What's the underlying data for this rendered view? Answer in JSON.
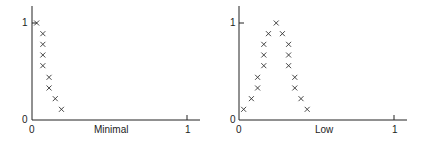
{
  "chart_data": [
    {
      "type": "scatter",
      "title": "",
      "xlabel": "Minimal",
      "ylabel": "",
      "xlim": [
        0,
        1
      ],
      "ylim": [
        0,
        1
      ],
      "x_ticks": [
        "0",
        "1"
      ],
      "y_ticks": [
        "0",
        "1"
      ],
      "grid": false,
      "marker": "x",
      "points": [
        {
          "x": 0.03,
          "y": 1.0
        },
        {
          "x": 0.07,
          "y": 0.89
        },
        {
          "x": 0.07,
          "y": 0.78
        },
        {
          "x": 0.07,
          "y": 0.67
        },
        {
          "x": 0.07,
          "y": 0.56
        },
        {
          "x": 0.11,
          "y": 0.44
        },
        {
          "x": 0.11,
          "y": 0.33
        },
        {
          "x": 0.15,
          "y": 0.22
        },
        {
          "x": 0.19,
          "y": 0.11
        }
      ]
    },
    {
      "type": "scatter",
      "title": "",
      "xlabel": "Low",
      "ylabel": "",
      "xlim": [
        0,
        1
      ],
      "ylim": [
        0,
        1
      ],
      "x_ticks": [
        "0",
        "1"
      ],
      "y_ticks": [
        "0",
        "1"
      ],
      "grid": false,
      "marker": "x",
      "points": [
        {
          "x": 0.03,
          "y": 0.11
        },
        {
          "x": 0.08,
          "y": 0.22
        },
        {
          "x": 0.12,
          "y": 0.33
        },
        {
          "x": 0.12,
          "y": 0.44
        },
        {
          "x": 0.16,
          "y": 0.56
        },
        {
          "x": 0.16,
          "y": 0.67
        },
        {
          "x": 0.16,
          "y": 0.78
        },
        {
          "x": 0.19,
          "y": 0.89
        },
        {
          "x": 0.24,
          "y": 1.0
        },
        {
          "x": 0.28,
          "y": 0.89
        },
        {
          "x": 0.32,
          "y": 0.78
        },
        {
          "x": 0.32,
          "y": 0.67
        },
        {
          "x": 0.32,
          "y": 0.56
        },
        {
          "x": 0.36,
          "y": 0.44
        },
        {
          "x": 0.36,
          "y": 0.33
        },
        {
          "x": 0.4,
          "y": 0.22
        },
        {
          "x": 0.44,
          "y": 0.11
        }
      ]
    }
  ],
  "charts": [
    {
      "xlabel": "Minimal",
      "x0": "0",
      "x1": "1",
      "y0": "0",
      "y1": "1"
    },
    {
      "xlabel": "Low",
      "x0": "0",
      "x1": "1",
      "y0": "0",
      "y1": "1"
    }
  ],
  "colors": {
    "axis": "#222222",
    "marker": "#333333"
  }
}
